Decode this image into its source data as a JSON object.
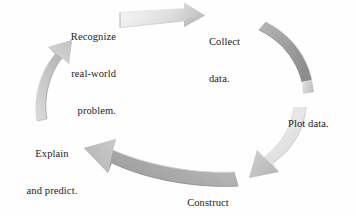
{
  "figure": {
    "type": "cycle-diagram",
    "background_color": "#fefefe",
    "text_color": "#1c1c1c",
    "stage_count": 5
  },
  "stages": [
    {
      "id": "recognize",
      "line1": "Recognize",
      "line2": "real-world",
      "line3": "problem."
    },
    {
      "id": "collect",
      "line1": "Collect",
      "line2": "data."
    },
    {
      "id": "plot",
      "line1": "Plot data."
    },
    {
      "id": "construct",
      "line1": "Construct",
      "line2": "model."
    },
    {
      "id": "explain",
      "line1": "Explain",
      "line2": "and predict."
    }
  ],
  "arrows": [
    {
      "id": "arrow-top",
      "from": "recognize",
      "to": "collect",
      "direction": "right",
      "shade": "#e9e9e9",
      "edge": "#bdbdbd"
    },
    {
      "id": "arrow-right-upper",
      "from": "collect",
      "to": "plot",
      "direction": "down-right",
      "shade": "#a6a6a6",
      "edge": "#8e8e8e"
    },
    {
      "id": "arrow-right-lower",
      "from": "plot",
      "to": "construct",
      "direction": "down-left",
      "shade": "#ededed",
      "edge": "#c9c9c9"
    },
    {
      "id": "arrow-bottom",
      "from": "construct",
      "to": "explain",
      "direction": "left",
      "shade": "#b0b0b0",
      "edge": "#949494"
    },
    {
      "id": "arrow-left",
      "from": "explain",
      "to": "recognize",
      "direction": "up",
      "shade": "#c6c6c6",
      "edge": "#a8a8a8"
    }
  ]
}
